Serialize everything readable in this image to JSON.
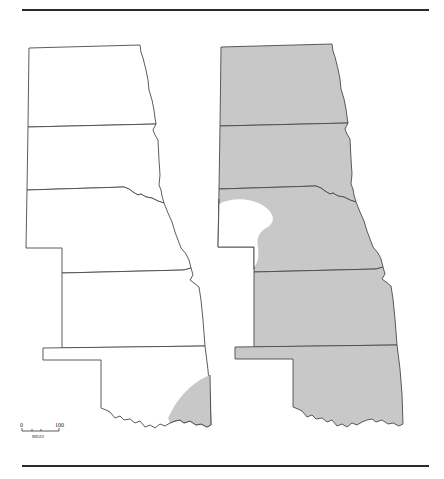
{
  "figure": {
    "panels": [
      {
        "name": "left-map",
        "description": "State outlines, mostly unshaded",
        "shaded_region": "southeast Oklahoma corner"
      },
      {
        "name": "right-map",
        "description": "State outlines, shaded",
        "unshaded_region": "western Nebraska panhandle area"
      }
    ],
    "states": [
      "North Dakota",
      "South Dakota",
      "Nebraska",
      "Kansas",
      "Oklahoma"
    ],
    "scale_bar": {
      "start_label": "0",
      "end_label": "100",
      "units_label": "MILES"
    },
    "colors": {
      "shade": "#c8c8c8",
      "outline": "#4a4a4a",
      "rule": "#2a2a2a"
    }
  }
}
